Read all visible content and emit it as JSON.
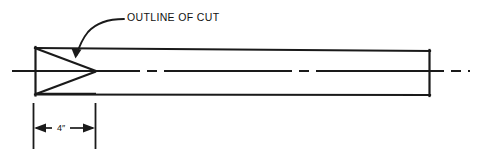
{
  "drawing": {
    "title": "Tapered stock with angled outline of cut",
    "background_color": "#ffffff",
    "line_color": "#1a1a1a",
    "annotations": {
      "cut_label": {
        "text": "OUTLINE OF CUT",
        "x": 127,
        "y": 21,
        "leader_from_x": 124,
        "leader_to_x": 76,
        "leader_to_y": 56
      },
      "dimension": {
        "text": "4″",
        "value": 4,
        "unit": "inch",
        "x": 57,
        "y": 131,
        "extension_left_x": 33,
        "extension_right_x": 95,
        "extension_top_y": 103,
        "extension_bottom_y": 149,
        "dimension_line_y": 128
      }
    },
    "geometry": {
      "body_outline": {
        "left_top": [
          35,
          48
        ],
        "right_top": [
          430,
          51
        ],
        "right_bottom": [
          430,
          95
        ],
        "left_bottom": [
          35,
          94
        ]
      },
      "cut_upper": {
        "from": [
          35,
          48
        ],
        "to": [
          96,
          71
        ]
      },
      "cut_lower": {
        "from": [
          35,
          94
        ],
        "to": [
          96,
          71
        ]
      },
      "cut_lower_edge": {
        "from": [
          35,
          94
        ],
        "to": [
          96,
          93
        ]
      },
      "centerline": {
        "from_x": 12,
        "to_x": 470,
        "y": 71,
        "pattern": "long-dash short-dash"
      }
    }
  }
}
